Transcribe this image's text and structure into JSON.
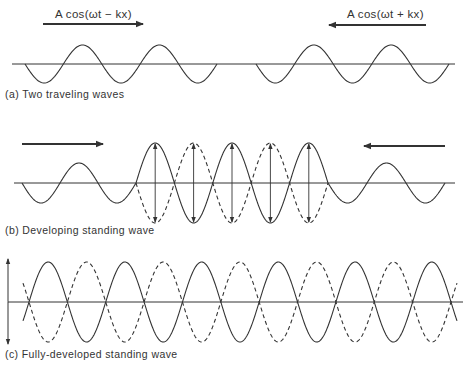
{
  "figure": {
    "stroke_color": "#333333",
    "background": "#ffffff",
    "panels": [
      {
        "id": "a",
        "caption": "(a) Two traveling waves",
        "caption_pos": [
          5,
          88
        ],
        "axis": {
          "y": 64,
          "x1": 12,
          "x2": 455
        },
        "labels": [
          {
            "text": "A cos(ωt − kx)",
            "x": 55,
            "y": 8
          },
          {
            "text": "A cos(ωt + kx)",
            "x": 347,
            "y": 8
          }
        ],
        "arrows": [
          {
            "x1": 43,
            "x2": 143,
            "y": 24,
            "direction": "right"
          },
          {
            "x1": 426,
            "x2": 329,
            "y": 25,
            "direction": "left"
          }
        ],
        "traveling_waves": [
          {
            "x_start": 25,
            "x_end": 217,
            "amplitude": 19,
            "half_period": 38.4,
            "start_phase": "down"
          },
          {
            "x_start": 256,
            "x_end": 449,
            "amplitude": 19,
            "half_period": 38.6,
            "start_phase": "down"
          }
        ]
      },
      {
        "id": "b",
        "caption": "(b) Developing standing wave",
        "caption_pos": [
          5,
          224
        ],
        "axis": {
          "y": 183,
          "x1": 14,
          "x2": 455
        },
        "arrows": [
          {
            "x1": 22,
            "x2": 103,
            "y": 144,
            "direction": "right"
          },
          {
            "x1": 445,
            "x2": 364,
            "y": 146,
            "direction": "left"
          }
        ],
        "traveling_waves": [
          {
            "x_start": 22,
            "x_end": 136,
            "amplitude": 20,
            "half_period": 38,
            "start_phase": "down"
          },
          {
            "x_start": 328,
            "x_end": 445,
            "amplitude": 20,
            "half_period": 39,
            "start_phase": "down"
          }
        ],
        "standing_wave": {
          "x_start": 136,
          "x_end": 328,
          "loops": 5,
          "amplitude": 40,
          "extend_ends": false,
          "arrows": true
        }
      },
      {
        "id": "c",
        "caption": "(c) Fully-developed standing wave",
        "caption_pos": [
          5,
          348
        ],
        "axis": {
          "y": 302,
          "x1": 8,
          "x2": 463
        },
        "amplitude_arrow": {
          "x": 8,
          "y1": 259,
          "y2": 344
        },
        "standing_wave": {
          "x_start": 29,
          "x_end": 451,
          "loops": 11,
          "amplitude": 40,
          "extend_ends": true,
          "arrows": false
        }
      }
    ]
  }
}
